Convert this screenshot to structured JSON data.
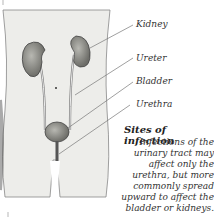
{
  "labels": {
    "kidney": "Kidney",
    "ureter": "Ureter",
    "bladder": "Bladder",
    "urethra": "Urethra"
  },
  "caption": {
    "title": "Sites of infection",
    "text": "Infections of the urinary tract may affect only the urethra, but more commonly spread upward to affect the bladder or kidneys."
  },
  "colors": {
    "body": "#ededea",
    "organ": "#8a8a84",
    "line": "#666"
  }
}
